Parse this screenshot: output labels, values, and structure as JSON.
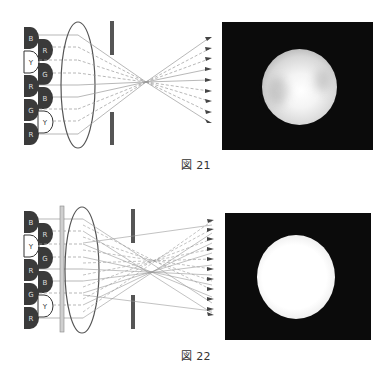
{
  "figures": [
    {
      "id": "fig21",
      "caption": "図 21",
      "leds_left": [
        "B",
        "Y",
        "R",
        "G",
        "R"
      ],
      "leds_right": [
        "R",
        "G",
        "B",
        "Y"
      ],
      "has_diffuser_plate": false,
      "result_image": "uneven-bright-spot"
    },
    {
      "id": "fig22",
      "caption": "図 22",
      "leds_left": [
        "B",
        "Y",
        "R",
        "G",
        "R"
      ],
      "leds_right": [
        "R",
        "G",
        "B",
        "Y"
      ],
      "has_diffuser_plate": true,
      "result_image": "uniform-bright-spot"
    }
  ],
  "colors": {
    "led_dark": "#3a3a3a",
    "led_yellow_fill": "#ffffff",
    "ray": "#888888",
    "aperture": "#555555",
    "photo_bg": "#0b0b0b"
  }
}
